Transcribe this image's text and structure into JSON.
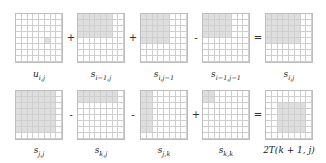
{
  "grid_size": {
    "rows": 8,
    "cols": 8
  },
  "shade_color": "#dedede",
  "rows": [
    {
      "items": [
        {
          "label_base": "u",
          "label_sub": "i,j",
          "shaded": {
            "r0": 4,
            "r1": 4,
            "c0": 5,
            "c1": 5
          }
        },
        {
          "op": "+"
        },
        {
          "label_base": "s",
          "label_sub": "i−1,j",
          "shaded": {
            "r0": 0,
            "r1": 3,
            "c0": 0,
            "c1": 5
          }
        },
        {
          "op": "+"
        },
        {
          "label_base": "s",
          "label_sub": "i,j−1",
          "shaded": {
            "r0": 0,
            "r1": 4,
            "c0": 0,
            "c1": 4
          }
        },
        {
          "op": "-"
        },
        {
          "label_base": "s",
          "label_sub": "i−1,j−1",
          "shaded": {
            "r0": 0,
            "r1": 3,
            "c0": 0,
            "c1": 4
          }
        },
        {
          "op": "="
        },
        {
          "label_base": "s",
          "label_sub": "i,j",
          "shaded": {
            "r0": 0,
            "r1": 4,
            "c0": 0,
            "c1": 5
          }
        }
      ]
    },
    {
      "items": [
        {
          "label_base": "s",
          "label_sub": "j,j",
          "shaded": {
            "r0": 0,
            "r1": 6,
            "c0": 0,
            "c1": 6
          }
        },
        {
          "op": "-"
        },
        {
          "label_base": "s",
          "label_sub": "k,j",
          "shaded": {
            "r0": 0,
            "r1": 1,
            "c0": 0,
            "c1": 6
          }
        },
        {
          "op": "-"
        },
        {
          "label_base": "s",
          "label_sub": "j,k",
          "shaded": {
            "r0": 0,
            "r1": 6,
            "c0": 0,
            "c1": 1
          }
        },
        {
          "op": "+"
        },
        {
          "label_base": "s",
          "label_sub": "k,k",
          "shaded": {
            "r0": 0,
            "r1": 1,
            "c0": 0,
            "c1": 1
          }
        },
        {
          "op": "="
        },
        {
          "label_full": "2T(k + 1, j)",
          "shaded": {
            "r0": 2,
            "r1": 6,
            "c0": 2,
            "c1": 6
          }
        }
      ]
    }
  ]
}
